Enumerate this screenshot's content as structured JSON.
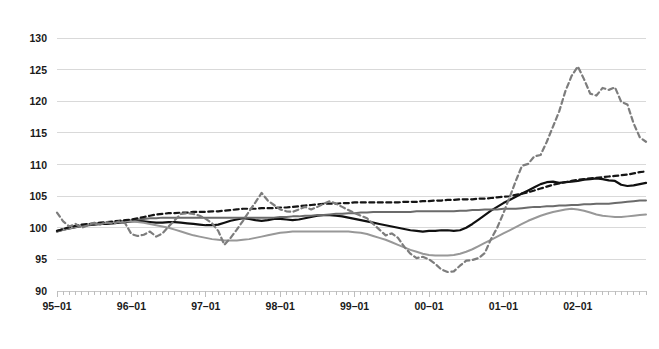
{
  "chart_data": {
    "type": "line",
    "title": "",
    "subtitle": "",
    "xlabel": "",
    "ylabel": "",
    "ylim": [
      90,
      130
    ],
    "ytick_values": [
      90,
      95,
      100,
      105,
      110,
      115,
      120,
      125,
      130
    ],
    "ytick_labels": [
      "90",
      "95",
      "100",
      "105",
      "110",
      "115",
      "120",
      "125",
      "130"
    ],
    "xtick_labels": [
      "95–01",
      "96–01",
      "97–01",
      "98–01",
      "99–01",
      "00–01",
      "01–01",
      "02–01"
    ],
    "x_start": "95–01",
    "x_end": "02–12",
    "x_points": 96,
    "x_interval_months": 1,
    "grid": true,
    "legend": "none",
    "minor_ticks": "monthly",
    "series": [
      {
        "name": "solid-black",
        "color": "#101010",
        "style": "solid",
        "width": 2.2,
        "values": [
          99.4,
          99.7,
          99.9,
          100.1,
          100.3,
          100.4,
          100.5,
          100.6,
          100.6,
          100.7,
          100.8,
          100.9,
          101.0,
          101.1,
          101.0,
          100.9,
          100.8,
          100.8,
          100.9,
          100.9,
          100.8,
          100.7,
          100.6,
          100.5,
          100.4,
          100.4,
          100.5,
          100.8,
          101.1,
          101.3,
          101.5,
          101.4,
          101.2,
          101.1,
          101.2,
          101.4,
          101.4,
          101.3,
          101.2,
          101.3,
          101.5,
          101.7,
          101.9,
          102.0,
          102.0,
          101.9,
          101.8,
          101.6,
          101.4,
          101.2,
          101.0,
          100.8,
          100.6,
          100.4,
          100.2,
          100.0,
          99.8,
          99.6,
          99.5,
          99.4,
          99.5,
          99.5,
          99.6,
          99.6,
          99.5,
          99.6,
          100.0,
          100.6,
          101.3,
          102.0,
          102.7,
          103.3,
          103.9,
          104.4,
          104.9,
          105.4,
          105.9,
          106.4,
          106.9,
          107.2,
          107.3,
          107.1,
          107.2,
          107.3,
          107.4,
          107.6,
          107.7,
          107.8,
          107.7,
          107.5,
          107.4,
          106.8,
          106.6,
          106.7,
          106.9,
          107.1
        ]
      },
      {
        "name": "solid-dark-gray",
        "color": "#6b6b6b",
        "style": "solid",
        "width": 2.0,
        "values": [
          99.5,
          99.8,
          100.0,
          100.2,
          100.4,
          100.5,
          100.6,
          100.7,
          100.8,
          100.9,
          101.0,
          101.1,
          101.2,
          101.3,
          101.4,
          101.5,
          101.5,
          101.6,
          101.6,
          101.6,
          101.6,
          101.6,
          101.6,
          101.6,
          101.6,
          101.6,
          101.6,
          101.6,
          101.6,
          101.6,
          101.6,
          101.6,
          101.6,
          101.6,
          101.6,
          101.6,
          101.7,
          101.7,
          101.8,
          101.8,
          101.9,
          101.9,
          102.0,
          102.0,
          102.1,
          102.2,
          102.2,
          102.3,
          102.3,
          102.4,
          102.4,
          102.5,
          102.5,
          102.5,
          102.5,
          102.5,
          102.5,
          102.5,
          102.6,
          102.6,
          102.6,
          102.6,
          102.6,
          102.6,
          102.6,
          102.7,
          102.7,
          102.8,
          102.8,
          102.9,
          102.9,
          102.9,
          103.0,
          103.0,
          103.0,
          103.1,
          103.2,
          103.3,
          103.3,
          103.4,
          103.4,
          103.5,
          103.5,
          103.6,
          103.6,
          103.7,
          103.7,
          103.8,
          103.8,
          103.8,
          103.9,
          104.0,
          104.1,
          104.2,
          104.3,
          104.3
        ]
      },
      {
        "name": "solid-light-gray",
        "color": "#989898",
        "style": "solid",
        "width": 2.0,
        "values": [
          99.4,
          99.7,
          99.9,
          100.1,
          100.3,
          100.5,
          100.6,
          100.7,
          100.8,
          100.9,
          100.9,
          101.0,
          101.0,
          100.9,
          100.8,
          100.6,
          100.4,
          100.2,
          100.0,
          99.7,
          99.4,
          99.1,
          98.8,
          98.6,
          98.4,
          98.2,
          98.1,
          98.0,
          98.0,
          98.0,
          98.1,
          98.2,
          98.4,
          98.6,
          98.8,
          99.0,
          99.2,
          99.3,
          99.4,
          99.4,
          99.4,
          99.4,
          99.4,
          99.4,
          99.4,
          99.4,
          99.4,
          99.4,
          99.3,
          99.2,
          99.0,
          98.7,
          98.4,
          98.1,
          97.7,
          97.3,
          96.9,
          96.5,
          96.2,
          95.9,
          95.7,
          95.6,
          95.6,
          95.6,
          95.7,
          95.9,
          96.2,
          96.6,
          97.1,
          97.6,
          98.1,
          98.6,
          99.1,
          99.6,
          100.1,
          100.6,
          101.1,
          101.5,
          101.9,
          102.2,
          102.5,
          102.7,
          102.9,
          103.0,
          102.9,
          102.7,
          102.4,
          102.1,
          101.9,
          101.8,
          101.7,
          101.7,
          101.8,
          101.9,
          102.0,
          102.1
        ]
      },
      {
        "name": "dashed-black",
        "color": "#151515",
        "style": "dashed",
        "width": 2.2,
        "values": [
          99.5,
          99.8,
          100.1,
          100.3,
          100.5,
          100.6,
          100.7,
          100.8,
          100.9,
          101.0,
          101.1,
          101.2,
          101.3,
          101.5,
          101.7,
          101.9,
          102.1,
          102.2,
          102.3,
          102.3,
          102.4,
          102.4,
          102.5,
          102.5,
          102.5,
          102.6,
          102.6,
          102.7,
          102.8,
          102.9,
          103.0,
          103.0,
          103.0,
          103.1,
          103.1,
          103.1,
          103.2,
          103.2,
          103.3,
          103.4,
          103.5,
          103.6,
          103.7,
          103.8,
          103.8,
          103.8,
          103.9,
          103.9,
          104.0,
          104.0,
          104.0,
          104.0,
          104.0,
          104.0,
          104.0,
          104.0,
          104.1,
          104.1,
          104.1,
          104.2,
          104.2,
          104.3,
          104.3,
          104.4,
          104.4,
          104.5,
          104.5,
          104.5,
          104.6,
          104.6,
          104.7,
          104.8,
          104.9,
          105.0,
          105.2,
          105.4,
          105.6,
          105.9,
          106.2,
          106.5,
          106.8,
          107.0,
          107.2,
          107.4,
          107.6,
          107.7,
          107.8,
          107.9,
          108.0,
          108.1,
          108.2,
          108.3,
          108.4,
          108.6,
          108.8,
          108.9
        ]
      },
      {
        "name": "dashed-gray-volatile",
        "color": "#7d7d7d",
        "style": "dashed",
        "width": 2.2,
        "values": [
          102.4,
          101.0,
          100.2,
          100.6,
          100.0,
          100.4,
          100.8,
          100.5,
          100.9,
          100.6,
          101.0,
          100.7,
          99.0,
          98.7,
          98.9,
          99.4,
          98.6,
          99.1,
          100.2,
          101.2,
          102.2,
          102.3,
          102.2,
          101.9,
          101.4,
          100.7,
          99.5,
          97.3,
          98.4,
          99.7,
          101.1,
          102.6,
          104.0,
          105.5,
          104.3,
          103.6,
          102.9,
          102.6,
          102.5,
          102.9,
          103.3,
          102.9,
          103.3,
          103.8,
          104.2,
          103.8,
          103.3,
          102.8,
          102.3,
          101.9,
          101.5,
          100.6,
          99.7,
          98.8,
          99.1,
          98.4,
          97.0,
          95.9,
          95.2,
          95.4,
          95.0,
          94.3,
          93.4,
          93.0,
          93.1,
          94.0,
          94.8,
          94.9,
          95.2,
          96.0,
          98.2,
          100.0,
          102.3,
          104.8,
          107.4,
          109.8,
          110.1,
          111.3,
          111.5,
          113.6,
          116.0,
          118.4,
          121.6,
          124.0,
          125.5,
          123.5,
          121.2,
          120.9,
          122.1,
          121.8,
          122.2,
          119.9,
          119.5,
          116.5,
          114.3,
          113.6
        ]
      }
    ]
  }
}
